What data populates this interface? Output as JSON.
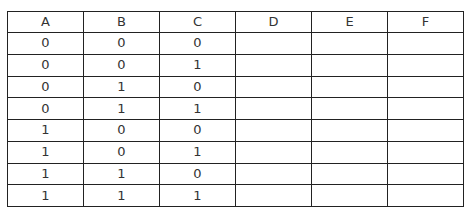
{
  "table": {
    "headers": [
      "A",
      "B",
      "C",
      "D",
      "E",
      "F"
    ],
    "rows": [
      [
        "0",
        "0",
        "0",
        "",
        "",
        ""
      ],
      [
        "0",
        "0",
        "1",
        "",
        "",
        ""
      ],
      [
        "0",
        "1",
        "0",
        "",
        "",
        ""
      ],
      [
        "0",
        "1",
        "1",
        "",
        "",
        ""
      ],
      [
        "1",
        "0",
        "0",
        "",
        "",
        ""
      ],
      [
        "1",
        "0",
        "1",
        "",
        "",
        ""
      ],
      [
        "1",
        "1",
        "0",
        "",
        "",
        ""
      ],
      [
        "1",
        "1",
        "1",
        "",
        "",
        ""
      ]
    ]
  }
}
